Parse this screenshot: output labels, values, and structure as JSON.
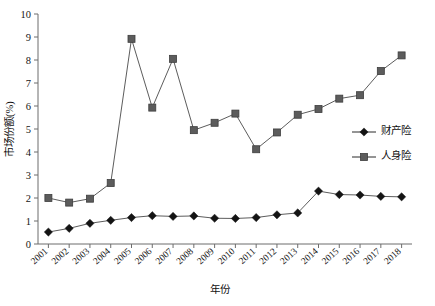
{
  "chart_data": {
    "type": "line",
    "title": "",
    "xlabel": "年份",
    "ylabel": "市场份额(%)",
    "categories": [
      "2001",
      "2002",
      "2003",
      "2004",
      "2005",
      "2006",
      "2007",
      "2008",
      "2009",
      "2010",
      "2011",
      "2012",
      "2013",
      "2014",
      "2015",
      "2016",
      "2017",
      "2018"
    ],
    "x": [
      2001,
      2002,
      2003,
      2004,
      2005,
      2006,
      2007,
      2008,
      2009,
      2010,
      2011,
      2012,
      2013,
      2014,
      2015,
      2016,
      2017,
      2018
    ],
    "series": [
      {
        "name": "财产险",
        "marker": "diamond",
        "color": "#141414",
        "values": [
          0.52,
          0.68,
          0.9,
          1.03,
          1.15,
          1.23,
          1.2,
          1.22,
          1.12,
          1.11,
          1.15,
          1.27,
          1.35,
          2.3,
          2.15,
          2.13,
          2.07,
          2.05
        ]
      },
      {
        "name": "人身险",
        "marker": "square",
        "color": "#5c5c5c",
        "values": [
          2.0,
          1.8,
          1.97,
          2.65,
          8.92,
          5.93,
          8.05,
          4.95,
          5.27,
          5.67,
          4.12,
          4.85,
          5.62,
          5.87,
          6.32,
          6.47,
          7.52,
          8.2
        ]
      }
    ],
    "yticks": [
      0,
      1,
      2,
      3,
      4,
      5,
      6,
      7,
      8,
      9,
      10
    ],
    "ytick_labels": [
      "0",
      "1",
      "2",
      "3",
      "4",
      "5",
      "6",
      "7",
      "8",
      "9",
      "10"
    ],
    "ylim": [
      0,
      10
    ],
    "xlim": [
      2000.5,
      2018.5
    ],
    "grid": false,
    "legend_position": "right-middle"
  },
  "legend": {
    "items": [
      {
        "label": "财产险",
        "marker": "diamond"
      },
      {
        "label": "人身险",
        "marker": "square"
      }
    ]
  },
  "axes": {
    "y_title": "市场份额(%)",
    "x_title": "年份"
  }
}
